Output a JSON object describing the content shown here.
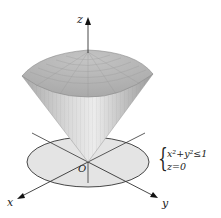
{
  "diagram": {
    "axes": {
      "x_label": "x",
      "y_label": "y",
      "z_label": "z",
      "origin_label": "O"
    },
    "condition": {
      "line1": "x²+y²≤1",
      "line2": "z=0"
    },
    "colors": {
      "surface": "#b9b9b9",
      "disk": "#e6e6e6",
      "axis": "#222222"
    }
  }
}
